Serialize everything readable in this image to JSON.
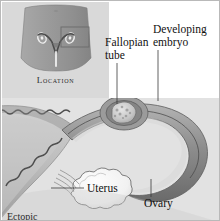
{
  "figure": {
    "kind": "anatomical-illustration",
    "style": "grayscale medical engraving"
  },
  "inset": {
    "caption": "Location",
    "description": "Pelvis silhouette with uterus and fallopian tubes outline; a rectangle highlights the right fallopian tube region."
  },
  "labels": {
    "fallopian_tube": "Fallopian\ntube",
    "developing_embryo": "Developing\nembryo",
    "uterus": "Uterus",
    "ovary": "Ovary"
  },
  "caption": {
    "text": "Ectopic"
  },
  "colors": {
    "page_background": "#ffffff",
    "frame_border": "#b9b9b9",
    "inset_background": "#d9d9d9",
    "main_background": "#e2e2e2",
    "tissue_mid": "#9a9a9a",
    "tissue_dark": "#5f5f5f",
    "tissue_light": "#cfcfcf",
    "lumen": "#f2f2f2",
    "label_text": "#101010",
    "leader_line": "#3a3a3a"
  }
}
